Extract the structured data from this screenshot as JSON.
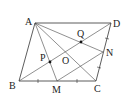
{
  "diagram": {
    "type": "geometry",
    "points": {
      "A": {
        "label": "A",
        "x": 35,
        "y": 23
      },
      "B": {
        "label": "B",
        "x": 19,
        "y": 81
      },
      "C": {
        "label": "C",
        "x": 96,
        "y": 81
      },
      "D": {
        "label": "D",
        "x": 111,
        "y": 23
      },
      "M": {
        "label": "M",
        "x": 57,
        "y": 81
      },
      "N": {
        "label": "N",
        "x": 103,
        "y": 52
      },
      "O": {
        "label": "O",
        "x": 65,
        "y": 52
      },
      "P": {
        "label": "P",
        "x": 50,
        "y": 62
      },
      "Q": {
        "label": "Q",
        "x": 81,
        "y": 42
      }
    },
    "segments": [
      "AB",
      "BC",
      "CD",
      "DA",
      "AC",
      "BD",
      "AM",
      "AN",
      "MN"
    ],
    "marked_equal": [
      "BM = MC",
      "CN = ND"
    ],
    "dots": [
      "P",
      "Q"
    ]
  }
}
